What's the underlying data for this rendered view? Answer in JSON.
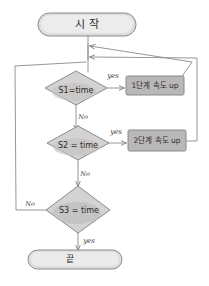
{
  "diagram": {
    "style": {
      "stroke": "#8a8a8a",
      "fill_light": "#eceaea",
      "fill_mid": "#d8d6d6",
      "fill_dark": "#c9c7c7",
      "text": "#2b2b2b",
      "background": "#ffffff"
    },
    "nodes": [
      {
        "id": "start",
        "type": "terminator",
        "label": "시 작"
      },
      {
        "id": "d1",
        "type": "decision",
        "label": "S1=time"
      },
      {
        "id": "p1",
        "type": "process",
        "label": "1단계 속도 up"
      },
      {
        "id": "d2",
        "type": "decision",
        "label": "S2 = time"
      },
      {
        "id": "p2",
        "type": "process",
        "label": "2단계 속도 up"
      },
      {
        "id": "d3",
        "type": "decision",
        "label": "S3 = time"
      },
      {
        "id": "end",
        "type": "terminator",
        "label": "끝"
      }
    ],
    "edges": [
      {
        "from": "start",
        "to": "d1",
        "label": ""
      },
      {
        "from": "d1",
        "to": "p1",
        "label": "yes"
      },
      {
        "from": "d1",
        "to": "d2",
        "label": "No"
      },
      {
        "from": "d2",
        "to": "p2",
        "label": "yes"
      },
      {
        "from": "d2",
        "to": "d3",
        "label": "No"
      },
      {
        "from": "d3",
        "to": "end",
        "label": "yes"
      },
      {
        "from": "d3",
        "to": "d1",
        "label": "No"
      },
      {
        "from": "p1",
        "to": "d1",
        "label": ""
      },
      {
        "from": "p2",
        "to": "d1",
        "label": ""
      }
    ],
    "edge_labels": {
      "yes1": "yes",
      "no1": "No",
      "yes2": "yes",
      "no2": "No",
      "no3": "No",
      "yes3": "yes"
    }
  }
}
